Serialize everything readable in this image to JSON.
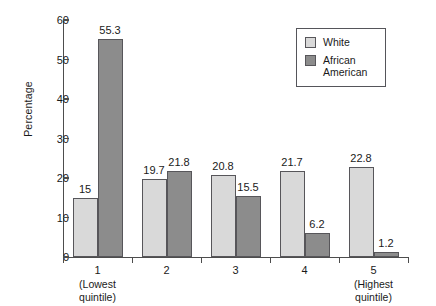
{
  "chart_data": {
    "type": "bar",
    "title": "",
    "xlabel": "",
    "ylabel": "Percentage",
    "ylim": [
      0,
      60
    ],
    "yticks": [
      0,
      10,
      20,
      30,
      40,
      50,
      60
    ],
    "ytick_labels": [
      "0",
      "10",
      "20",
      "30",
      "40",
      "50",
      "60"
    ],
    "grid": false,
    "legend_position": "upper right",
    "categories": [
      "1",
      "2",
      "3",
      "4",
      "5"
    ],
    "category_sublabels": [
      "(Lowest quintile)",
      "",
      "",
      "",
      "(Highest quintile)"
    ],
    "series": [
      {
        "name": "White",
        "color": "#d9d9d9",
        "values": [
          15,
          19.7,
          20.8,
          21.7,
          22.8
        ],
        "value_labels": [
          "15",
          "19.7",
          "20.8",
          "21.7",
          "22.8"
        ]
      },
      {
        "name": "African American",
        "color": "#8c8c8c",
        "values": [
          55.3,
          21.8,
          15.5,
          6.2,
          1.2
        ],
        "value_labels": [
          "55.3",
          "21.8",
          "15.5",
          "6.2",
          "1.2"
        ]
      }
    ]
  },
  "legend": {
    "entries": [
      {
        "label": "White"
      },
      {
        "label": "African American"
      }
    ]
  },
  "colors": {
    "series_white": "#d9d9d9",
    "series_african_american": "#8c8c8c",
    "axis": "#4d4d4d",
    "text": "#1a1a1a",
    "background": "#ffffff"
  }
}
